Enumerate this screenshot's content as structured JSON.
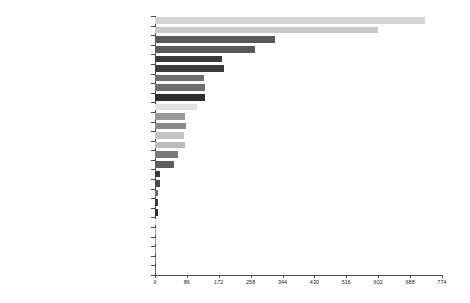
{
  "chart_data": {
    "type": "bar",
    "orientation": "horizontal",
    "title": "",
    "subtitle": "",
    "xlabel": "",
    "ylabel": "",
    "grid": false,
    "legend": null,
    "xlim": [
      0,
      774
    ],
    "xticks": [
      0,
      86,
      172,
      258,
      344,
      430,
      516,
      602,
      688,
      774
    ],
    "categories": [
      "MARKETING ENTRY MODE - FDI",
      "MARKETING ENTRY MODE - EXPORT",
      "INTERNATIONAL MARKETING",
      "BRANDING",
      "MARKETING ENTRY MODE - STRATEGIC ALLIANCE",
      "MARKETING ENTRY MODE - IJV",
      "SEGMENTATION",
      "MARKETING ENTRY MODE - M&A",
      "COUNTRY OF ORIGIN",
      "EXPORT MARKETING",
      "GLOBAL BRANDING",
      "MARKETING ENTRY MODE - WOS",
      "GLOBAL ADVERTISING",
      "MARKETING ENTRY MODE - CONTRACTS",
      "MARKETING ENTRY MODE - LICENSING",
      "NATIONAL BRANDING",
      "PRIVATE BRANDING",
      "GLOBAL PRICING",
      "GRAY MARKET",
      "COUNTERFEIT",
      "FOREIGN BRANDING",
      "REGIONAL BRANDING",
      "LUXURY BRANDING",
      "LOCAL  ADVERTISING",
      "IMPORT MARKETING",
      "LICENSING MARKETING",
      "MACROMARKETING"
    ],
    "values": [
      728,
      601,
      323,
      269,
      180,
      185,
      132,
      135,
      135,
      113,
      81,
      83,
      78,
      81,
      62,
      51,
      13,
      13,
      9,
      9,
      9,
      3,
      2,
      2,
      2,
      2,
      1
    ],
    "bar_colors": [
      "#d4d4d4",
      "#c9c9c9",
      "#585858",
      "#585858",
      "#3a3a3a",
      "#3a3a3a",
      "#6e6e6e",
      "#6e6e6e",
      "#2e2e2e",
      "#e2e2e2",
      "#9a9a9a",
      "#8a8a8a",
      "#c4c4c4",
      "#bcbcbc",
      "#787878",
      "#5e5e5e",
      "#3a3a3a",
      "#4a4a4a",
      "#6a6a6a",
      "#3a3a3a",
      "#2e2e2e",
      "#d8d8d8",
      "#b0b0b0",
      "#9a9a9a",
      "#8a8a8a",
      "#7a7a7a",
      "#6a6a6a"
    ]
  },
  "axis": {
    "tick_labels": [
      "0",
      "86",
      "172",
      "258",
      "344",
      "430",
      "516",
      "602",
      "688",
      "774"
    ]
  }
}
